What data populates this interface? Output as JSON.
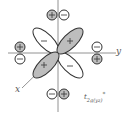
{
  "diagram": {
    "type": "molecular-orbital",
    "orbital_label": {
      "base": "t",
      "subscript": "2g(yz)",
      "superscript": "*"
    },
    "axes": {
      "x_label": "x",
      "y_label": "y"
    },
    "central_lobes": [
      {
        "position": "upper-right",
        "sign": "+",
        "shaded": true
      },
      {
        "position": "upper-left",
        "sign": "−",
        "shaded": false
      },
      {
        "position": "lower-right",
        "sign": "−",
        "shaded": false
      },
      {
        "position": "lower-left",
        "sign": "+",
        "shaded": true
      }
    ],
    "ligand_orbitals": [
      {
        "position": "top",
        "lobes": [
          {
            "sign": "+",
            "shaded": true
          },
          {
            "sign": "−",
            "shaded": false
          }
        ]
      },
      {
        "position": "left",
        "lobes": [
          {
            "sign": "+",
            "shaded": true
          },
          {
            "sign": "−",
            "shaded": false
          }
        ]
      },
      {
        "position": "right",
        "lobes": [
          {
            "sign": "−",
            "shaded": false
          },
          {
            "sign": "+",
            "shaded": true
          }
        ]
      },
      {
        "position": "bottom",
        "lobes": [
          {
            "sign": "−",
            "shaded": false
          },
          {
            "sign": "+",
            "shaded": true
          }
        ]
      }
    ],
    "colors": {
      "shaded": "#bdbdbd",
      "line": "#333333",
      "axis": "#666666"
    }
  }
}
